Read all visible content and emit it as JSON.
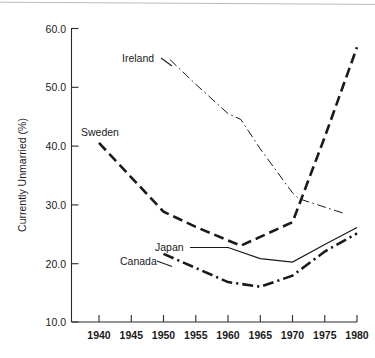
{
  "figure": {
    "caption": "",
    "background_color": "#ffffff",
    "ink_color": "#1a1a1a"
  },
  "chart_data": {
    "type": "line",
    "title": "",
    "xlabel": "",
    "ylabel": "Currently Unmarried (%)",
    "xlim": [
      1938,
      1981
    ],
    "ylim": [
      10.0,
      60.0
    ],
    "grid": false,
    "legend_position": "inline-labels",
    "x_tick_labels": [
      "1940",
      "1945",
      "1950",
      "1955",
      "1960",
      "1965",
      "1970",
      "1975",
      "1980"
    ],
    "x_ticks": [
      1940,
      1945,
      1950,
      1955,
      1960,
      1965,
      1970,
      1975,
      1980
    ],
    "y_tick_labels": [
      "60.0",
      "50.0",
      "40.0",
      "30.0",
      "20.0",
      "10.0"
    ],
    "y_ticks": [
      60.0,
      50.0,
      40.0,
      30.0,
      20.0,
      10.0
    ],
    "series": [
      {
        "name": "Ireland",
        "line_style": "thin-dash-dot",
        "stroke_width": 1.0,
        "color": "#1a1a1a",
        "x": [
          1951,
          1955,
          1960,
          1962,
          1965,
          1970,
          1971,
          1978
        ],
        "values": [
          54.7,
          50.5,
          45.5,
          44.5,
          39.5,
          32.0,
          31.0,
          28.5
        ]
      },
      {
        "name": "Sweden",
        "line_style": "bold-dash",
        "stroke_width": 2.6,
        "color": "#1a1a1a",
        "x": [
          1940,
          1950,
          1955,
          1960,
          1962,
          1965,
          1970,
          1975,
          1980
        ],
        "values": [
          40.5,
          28.8,
          26.2,
          23.9,
          23.0,
          24.5,
          27.0,
          41.5,
          56.8
        ]
      },
      {
        "name": "Japan",
        "line_style": "thin-solid",
        "stroke_width": 1.2,
        "color": "#1a1a1a",
        "x": [
          1960,
          1965,
          1970,
          1975,
          1980
        ],
        "values": [
          22.7,
          20.8,
          20.2,
          23.2,
          26.1
        ]
      },
      {
        "name": "Canada",
        "line_style": "bold-dash-dot",
        "stroke_width": 2.6,
        "color": "#1a1a1a",
        "x": [
          1950,
          1955,
          1960,
          1965,
          1970,
          1975,
          1980
        ],
        "values": [
          21.6,
          19.2,
          16.8,
          16.0,
          17.9,
          22.0,
          25.1
        ]
      }
    ],
    "annotations": [
      {
        "text": "Ireland",
        "series": "Ireland",
        "has_leader_line": true
      },
      {
        "text": "Sweden",
        "series": "Sweden",
        "has_leader_line": false
      },
      {
        "text": "Japan",
        "series": "Japan",
        "has_leader_line": true
      },
      {
        "text": "Canada",
        "series": "Canada",
        "has_leader_line": true
      }
    ]
  }
}
